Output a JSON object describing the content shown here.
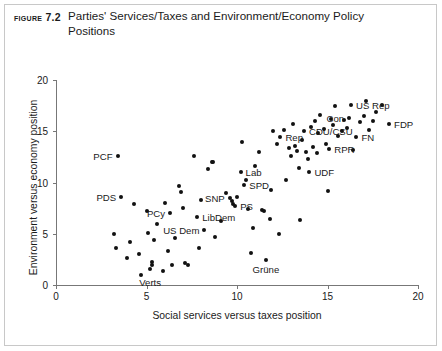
{
  "figure": {
    "number_label": "Figure 7.2",
    "title": "Parties' Services/Taxes and Environment/Economy Policy Positions"
  },
  "chart_data": {
    "type": "scatter",
    "title": "Parties' Services/Taxes and Environment/Economy Policy Positions",
    "xlabel": "Social services versus taxes position",
    "ylabel": "Environment versus economy position",
    "xlim": [
      0,
      20
    ],
    "ylim": [
      0,
      20
    ],
    "xticks": [
      0,
      5,
      10,
      15,
      20
    ],
    "yticks": [
      0,
      5,
      10,
      15,
      20
    ],
    "xtick_labels": [
      "0",
      "5",
      "10",
      "15",
      "20"
    ],
    "ytick_labels": [
      "0",
      "5",
      "10",
      "15",
      "20"
    ],
    "grid": false,
    "legend": "none",
    "marker_color": "#111111",
    "axis_color": "#777777",
    "labeled_points": [
      {
        "label": "PCF",
        "x": 3.4,
        "y": 12.6,
        "label_pos": "left"
      },
      {
        "label": "PDS",
        "x": 3.6,
        "y": 8.6,
        "label_pos": "left"
      },
      {
        "label": "PCy",
        "x": 6.3,
        "y": 7.0,
        "label_pos": "left"
      },
      {
        "label": "US Dem",
        "x": 8.2,
        "y": 5.4,
        "label_pos": "left"
      },
      {
        "label": "LibDem",
        "x": 7.8,
        "y": 6.6,
        "label_pos": "right"
      },
      {
        "label": "SNP",
        "x": 9.6,
        "y": 8.5,
        "label_pos": "left"
      },
      {
        "label": "PS",
        "x": 9.9,
        "y": 7.7,
        "label_pos": "right"
      },
      {
        "label": "Lab",
        "x": 10.2,
        "y": 11.0,
        "label_pos": "right"
      },
      {
        "label": "SPD",
        "x": 10.4,
        "y": 9.8,
        "label_pos": "right"
      },
      {
        "label": "Verts",
        "x": 5.2,
        "y": 1.2,
        "label_pos": "below"
      },
      {
        "label": "Grüne",
        "x": 11.6,
        "y": 2.4,
        "label_pos": "below"
      },
      {
        "label": "Rep",
        "x": 12.4,
        "y": 14.4,
        "label_pos": "right"
      },
      {
        "label": "CDU/CSU",
        "x": 13.7,
        "y": 15.0,
        "label_pos": "right"
      },
      {
        "label": "UDF",
        "x": 14.0,
        "y": 11.0,
        "label_pos": "right"
      },
      {
        "label": "RPR",
        "x": 15.1,
        "y": 13.3,
        "label_pos": "right"
      },
      {
        "label": "Con",
        "x": 16.2,
        "y": 16.3,
        "label_pos": "left"
      },
      {
        "label": "US Rep",
        "x": 16.3,
        "y": 17.6,
        "label_pos": "right"
      },
      {
        "label": "FN",
        "x": 16.6,
        "y": 14.4,
        "label_pos": "right"
      },
      {
        "label": "FDP",
        "x": 18.4,
        "y": 15.7,
        "label_pos": "right"
      }
    ],
    "points": [
      {
        "x": 3.4,
        "y": 12.6
      },
      {
        "x": 3.6,
        "y": 8.6
      },
      {
        "x": 3.2,
        "y": 5.0
      },
      {
        "x": 3.3,
        "y": 3.6
      },
      {
        "x": 3.9,
        "y": 2.6
      },
      {
        "x": 4.1,
        "y": 4.2
      },
      {
        "x": 4.3,
        "y": 7.9
      },
      {
        "x": 4.6,
        "y": 3.0
      },
      {
        "x": 4.7,
        "y": 1.0
      },
      {
        "x": 5.0,
        "y": 7.2
      },
      {
        "x": 5.1,
        "y": 5.1
      },
      {
        "x": 5.2,
        "y": 1.6
      },
      {
        "x": 5.3,
        "y": 2.2
      },
      {
        "x": 5.3,
        "y": 2.0
      },
      {
        "x": 5.4,
        "y": 4.4
      },
      {
        "x": 5.6,
        "y": 6.0
      },
      {
        "x": 5.9,
        "y": 1.4
      },
      {
        "x": 6.0,
        "y": 8.0
      },
      {
        "x": 6.2,
        "y": 3.3
      },
      {
        "x": 6.3,
        "y": 7.0
      },
      {
        "x": 6.4,
        "y": 2.0
      },
      {
        "x": 6.6,
        "y": 4.6
      },
      {
        "x": 6.8,
        "y": 9.7
      },
      {
        "x": 6.9,
        "y": 9.1
      },
      {
        "x": 7.0,
        "y": 7.5
      },
      {
        "x": 7.1,
        "y": 2.1
      },
      {
        "x": 7.3,
        "y": 2.0
      },
      {
        "x": 7.6,
        "y": 12.6
      },
      {
        "x": 7.8,
        "y": 6.6
      },
      {
        "x": 7.9,
        "y": 3.6
      },
      {
        "x": 8.0,
        "y": 8.3
      },
      {
        "x": 8.2,
        "y": 5.4
      },
      {
        "x": 8.4,
        "y": 11.3
      },
      {
        "x": 8.6,
        "y": 12.0
      },
      {
        "x": 8.7,
        "y": 12.0
      },
      {
        "x": 8.8,
        "y": 4.7
      },
      {
        "x": 9.1,
        "y": 6.2
      },
      {
        "x": 9.4,
        "y": 9.0
      },
      {
        "x": 9.6,
        "y": 8.5
      },
      {
        "x": 9.7,
        "y": 8.2
      },
      {
        "x": 9.8,
        "y": 7.9
      },
      {
        "x": 9.9,
        "y": 7.7
      },
      {
        "x": 10.0,
        "y": 8.6
      },
      {
        "x": 10.2,
        "y": 11.0
      },
      {
        "x": 10.3,
        "y": 14.0
      },
      {
        "x": 10.4,
        "y": 9.8
      },
      {
        "x": 10.5,
        "y": 10.2
      },
      {
        "x": 10.6,
        "y": 7.4
      },
      {
        "x": 10.8,
        "y": 3.1
      },
      {
        "x": 10.9,
        "y": 5.6
      },
      {
        "x": 11.0,
        "y": 11.6
      },
      {
        "x": 11.2,
        "y": 13.0
      },
      {
        "x": 11.4,
        "y": 7.3
      },
      {
        "x": 11.5,
        "y": 7.2
      },
      {
        "x": 11.6,
        "y": 2.4
      },
      {
        "x": 11.8,
        "y": 6.4
      },
      {
        "x": 11.9,
        "y": 9.3
      },
      {
        "x": 12.0,
        "y": 15.0
      },
      {
        "x": 12.2,
        "y": 13.8
      },
      {
        "x": 12.3,
        "y": 5.0
      },
      {
        "x": 12.4,
        "y": 14.4
      },
      {
        "x": 12.6,
        "y": 15.1
      },
      {
        "x": 12.7,
        "y": 10.2
      },
      {
        "x": 12.9,
        "y": 13.4
      },
      {
        "x": 13.0,
        "y": 12.6
      },
      {
        "x": 13.1,
        "y": 15.7
      },
      {
        "x": 13.2,
        "y": 13.6
      },
      {
        "x": 13.3,
        "y": 13.1
      },
      {
        "x": 13.4,
        "y": 11.4
      },
      {
        "x": 13.5,
        "y": 6.3
      },
      {
        "x": 13.6,
        "y": 14.1
      },
      {
        "x": 13.7,
        "y": 15.0
      },
      {
        "x": 13.8,
        "y": 13.0
      },
      {
        "x": 13.9,
        "y": 12.3
      },
      {
        "x": 14.0,
        "y": 11.0
      },
      {
        "x": 14.1,
        "y": 15.4
      },
      {
        "x": 14.2,
        "y": 13.5
      },
      {
        "x": 14.3,
        "y": 16.0
      },
      {
        "x": 14.4,
        "y": 12.9
      },
      {
        "x": 14.5,
        "y": 14.8
      },
      {
        "x": 14.6,
        "y": 16.6
      },
      {
        "x": 14.8,
        "y": 15.2
      },
      {
        "x": 14.9,
        "y": 13.8
      },
      {
        "x": 15.0,
        "y": 9.2
      },
      {
        "x": 15.1,
        "y": 13.3
      },
      {
        "x": 15.2,
        "y": 16.2
      },
      {
        "x": 15.3,
        "y": 15.6
      },
      {
        "x": 15.4,
        "y": 17.5
      },
      {
        "x": 15.6,
        "y": 14.5
      },
      {
        "x": 15.8,
        "y": 15.0
      },
      {
        "x": 15.9,
        "y": 16.1
      },
      {
        "x": 16.1,
        "y": 15.3
      },
      {
        "x": 16.2,
        "y": 16.3
      },
      {
        "x": 16.3,
        "y": 17.6
      },
      {
        "x": 16.4,
        "y": 13.2
      },
      {
        "x": 16.6,
        "y": 14.4
      },
      {
        "x": 16.8,
        "y": 15.9
      },
      {
        "x": 17.0,
        "y": 16.5
      },
      {
        "x": 17.1,
        "y": 18.0
      },
      {
        "x": 17.3,
        "y": 15.1
      },
      {
        "x": 17.5,
        "y": 16.0
      },
      {
        "x": 17.7,
        "y": 16.9
      },
      {
        "x": 18.0,
        "y": 17.6
      },
      {
        "x": 18.4,
        "y": 15.7
      }
    ]
  }
}
